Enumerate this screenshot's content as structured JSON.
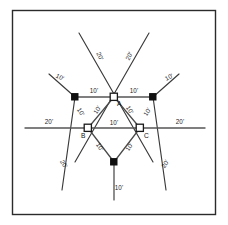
{
  "figure": {
    "units": "feet",
    "border_color": "#2b2b2b",
    "line_color": "#3a3a3a",
    "background_color": "#ffffff"
  },
  "vertices": [
    {
      "id": "A",
      "label": "A",
      "type": "open-square",
      "x": 114,
      "y": 97,
      "label_x": 117,
      "label_y": 106
    },
    {
      "id": "B",
      "label": "B",
      "type": "open-square",
      "x": 88,
      "y": 128,
      "label_x": 81,
      "label_y": 138
    },
    {
      "id": "C",
      "label": "C",
      "type": "open-square",
      "x": 140,
      "y": 128,
      "label_x": 144,
      "label_y": 138
    }
  ],
  "stations": [
    {
      "id": "P1",
      "type": "filled-dot",
      "x": 75,
      "y": 97
    },
    {
      "id": "P2",
      "type": "filled-dot",
      "x": 153,
      "y": 97
    },
    {
      "id": "P3",
      "type": "filled-dot",
      "x": 114,
      "y": 162
    }
  ],
  "dimensions": [
    {
      "id": "top-left-ray",
      "value": "20'",
      "x": 98,
      "y": 57,
      "rotate": 65
    },
    {
      "id": "top-right-ray",
      "value": "20'",
      "x": 131,
      "y": 57,
      "rotate": -65
    },
    {
      "id": "upper-left-ray",
      "value": "10'",
      "x": 59,
      "y": 79,
      "rotate": 27
    },
    {
      "id": "upper-right-ray",
      "value": "10'",
      "x": 170,
      "y": 79,
      "rotate": -27
    },
    {
      "id": "top-span-left",
      "value": "10'",
      "x": 94,
      "y": 93
    },
    {
      "id": "top-span-right",
      "value": "10'",
      "x": 134,
      "y": 93
    },
    {
      "id": "edge-ab-outer",
      "value": "10'",
      "x": 79,
      "y": 113,
      "rotate": 58
    },
    {
      "id": "edge-ab-inner",
      "value": "10'",
      "x": 99,
      "y": 111,
      "rotate": -58
    },
    {
      "id": "edge-ac-inner",
      "value": "10'",
      "x": 128,
      "y": 111,
      "rotate": 58
    },
    {
      "id": "edge-ac-outer",
      "value": "10'",
      "x": 149,
      "y": 113,
      "rotate": -58
    },
    {
      "id": "left-extension",
      "value": "20'",
      "x": 49,
      "y": 124
    },
    {
      "id": "right-extension",
      "value": "20'",
      "x": 180,
      "y": 124
    },
    {
      "id": "segment-bc",
      "value": "10'",
      "x": 114,
      "y": 125
    },
    {
      "id": "edge-b-bottom",
      "value": "10'",
      "x": 98,
      "y": 148,
      "rotate": 58
    },
    {
      "id": "edge-c-bottom",
      "value": "10'",
      "x": 131,
      "y": 148,
      "rotate": -58
    },
    {
      "id": "lower-left-ray",
      "value": "20'",
      "x": 62,
      "y": 165,
      "rotate": 58
    },
    {
      "id": "lower-right-ray",
      "value": "20'",
      "x": 167,
      "y": 165,
      "rotate": -58
    },
    {
      "id": "bottom-stub",
      "value": "10'",
      "x": 119,
      "y": 190
    }
  ]
}
